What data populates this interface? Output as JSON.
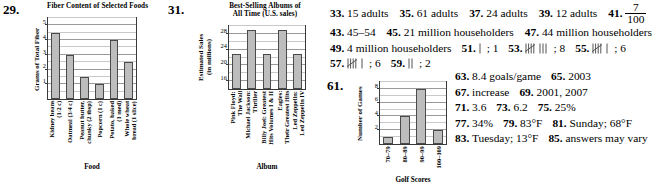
{
  "exercises": {
    "n29": "29.",
    "n31": "31.",
    "n61": "61."
  },
  "chart_data": [
    {
      "id": "fiber",
      "type": "bar",
      "title": "Fiber Content of Selected Foods",
      "xlabel": "Food",
      "ylabel": "Grams of Total Fiber",
      "categories": [
        "Kidney beans\n(1/2 c)",
        "Oatmeal (3/4 c)",
        "Peanut butter,\nchunky (2 tbsp)",
        "Popcorn (1 c)",
        "Potato, baked\n(1 med)",
        "Whole wheat\nbread (1 slice)"
      ],
      "values": [
        4.5,
        3,
        1.5,
        1,
        4,
        2.5
      ],
      "yticks": [
        1,
        2,
        3,
        4,
        5
      ],
      "ylim": [
        0,
        5.5
      ],
      "grid": true,
      "legend": "none"
    },
    {
      "id": "albums",
      "type": "bar",
      "title": "Best-Selling Albums of\nAll Time (U.S. sales)",
      "title_line1": "Best-Selling Albums of",
      "title_line2": "All Time (U.S. sales)",
      "xlabel": "Album",
      "ylabel": "Estimated Sales\n(in millions)",
      "ylabel_line1": "Estimated Sales",
      "ylabel_line2": "(in millions)",
      "categories": [
        "Pink Floyd:\nThe Wall",
        "Michael Jackson:\nThriller",
        "Billy Joel: Greatest\nHits Volumes I & II",
        "Eagles:\nTheir Greatest Hits",
        "Led Zeppelin:\nLed Zeppelin IV"
      ],
      "values": [
        23,
        29,
        23,
        29,
        23
      ],
      "yticks": [
        16,
        20,
        24,
        28
      ],
      "ylim": [
        14,
        30
      ],
      "grid": true,
      "legend": "none"
    },
    {
      "id": "golf",
      "type": "bar",
      "title": "",
      "xlabel": "Golf Scores",
      "ylabel": "Number of Games",
      "categories": [
        "70–79",
        "80–89",
        "90–99",
        "100–109"
      ],
      "values": [
        1,
        4,
        8,
        2
      ],
      "yticks": [
        2,
        4,
        6,
        8
      ],
      "ylim": [
        0,
        9
      ],
      "grid": true,
      "legend": "none"
    }
  ],
  "answers": {
    "row1": [
      {
        "num": "33.",
        "text": "15 adults"
      },
      {
        "num": "35.",
        "text": "61 adults"
      },
      {
        "num": "37.",
        "text": "24 adults"
      },
      {
        "num": "39.",
        "text": "12 adults"
      }
    ],
    "a41": {
      "num": "41.",
      "numerator": "7",
      "denominator": "100"
    },
    "row2": [
      {
        "num": "43.",
        "text": "45–54"
      },
      {
        "num": "45.",
        "text": "21 million householders"
      },
      {
        "num": "47.",
        "text": "44 million householders"
      }
    ],
    "row3": [
      {
        "num": "49.",
        "text": "4 million householders"
      },
      {
        "num": "51.",
        "tally": 1,
        "text": "; 1"
      },
      {
        "num": "53.",
        "tally": 8,
        "text": "; 8"
      },
      {
        "num": "55.",
        "tally": 6,
        "text": "; 6"
      }
    ],
    "row4": [
      {
        "num": "57.",
        "tally": 6,
        "text": "; 6"
      },
      {
        "num": "59.",
        "tally": 2,
        "text": "; 2"
      }
    ],
    "right": [
      [
        {
          "num": "63.",
          "text": "8.4 goals/game"
        },
        {
          "num": "65.",
          "text": "2003"
        }
      ],
      [
        {
          "num": "67.",
          "text": "increase"
        },
        {
          "num": "69.",
          "text": "2001, 2007"
        }
      ],
      [
        {
          "num": "71.",
          "text": "3.6"
        },
        {
          "num": "73.",
          "text": "6.2"
        },
        {
          "num": "75.",
          "text": "25%"
        }
      ],
      [
        {
          "num": "77.",
          "text": "34%"
        },
        {
          "num": "79.",
          "text": "83°F"
        },
        {
          "num": "81.",
          "text": "Sunday; 68°F"
        }
      ],
      [
        {
          "num": "83.",
          "text": "Tuesday; 13°F"
        },
        {
          "num": "85.",
          "text": "answers may vary"
        }
      ]
    ]
  }
}
